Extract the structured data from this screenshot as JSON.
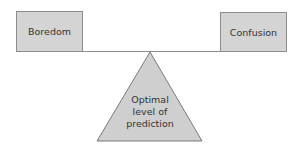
{
  "diagram": {
    "type": "balance-seesaw",
    "left_box": {
      "label": "Boredom"
    },
    "right_box": {
      "label": "Confusion"
    },
    "fulcrum": {
      "lines": [
        "Optimal",
        "level of",
        "prediction"
      ]
    },
    "colors": {
      "box_fill": "#d4d4d4",
      "box_stroke": "#8c8c8c",
      "triangle_fill": "#cfcfcf",
      "triangle_stroke": "#7a7a7a",
      "beam": "#8c8c8c",
      "text": "#333333"
    }
  }
}
